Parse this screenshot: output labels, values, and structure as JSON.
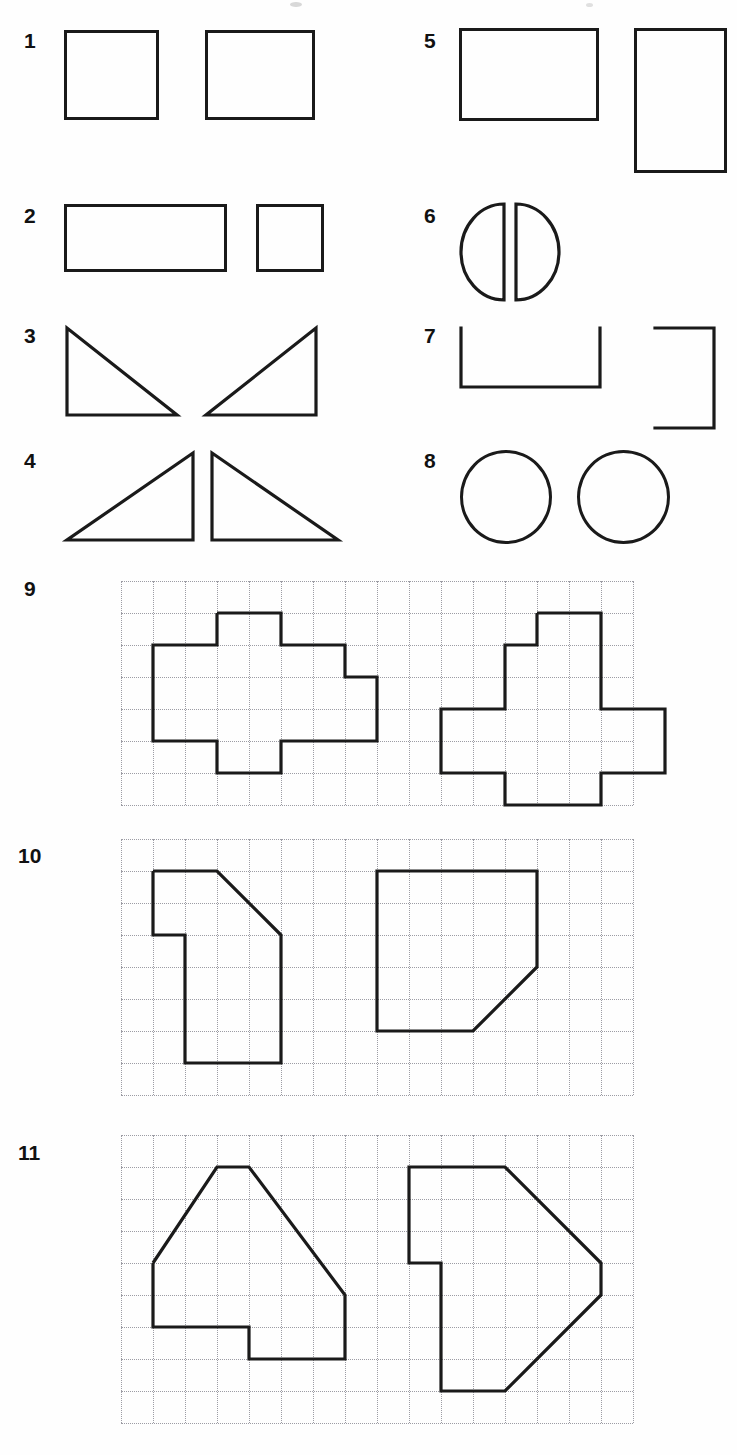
{
  "worksheet": {
    "title": "Congruent and rotated shape pairs worksheet",
    "background_color": "#fefefe",
    "stroke_color": "#1a1a1a",
    "grid_color": "#9c9ca4",
    "label_color": "#111111"
  },
  "items": [
    {
      "number": "1",
      "kind": "plain",
      "description": "two equal squares, side by side"
    },
    {
      "number": "2",
      "kind": "plain",
      "description": "wide rectangle and a small square"
    },
    {
      "number": "3",
      "kind": "plain",
      "description": "two right triangles, mirrored, apex up meeting at bottom centre"
    },
    {
      "number": "4",
      "kind": "plain",
      "description": "two right triangles, mirrored, vertical legs facing inwards"
    },
    {
      "number": "5",
      "kind": "plain",
      "description": "landscape rectangle and the same rectangle rotated 90 degrees"
    },
    {
      "number": "6",
      "kind": "plain",
      "description": "two semicircles, flat sides facing each other"
    },
    {
      "number": "7",
      "kind": "plain",
      "description": "U shape open at the top and the same shape rotated, open to the left"
    },
    {
      "number": "8",
      "kind": "plain",
      "description": "two equal circles"
    },
    {
      "number": "9",
      "kind": "grid",
      "description": "plus-like polyomino and its rotation on dotted grid"
    },
    {
      "number": "10",
      "kind": "grid",
      "description": "L shape with a chamfered corner and its rotation on dotted grid"
    },
    {
      "number": "11",
      "kind": "grid",
      "description": "house-like pentagon-ish polygon and its rotation on dotted grid"
    }
  ],
  "grid_specs": {
    "item9": {
      "cols": 16,
      "rows": 7,
      "cell": 32,
      "x": 121,
      "y": 581,
      "width": 512,
      "height": 224
    },
    "item10": {
      "cols": 16,
      "rows": 8,
      "cell": 32,
      "x": 121,
      "y": 839,
      "width": 512,
      "height": 256
    },
    "item11": {
      "cols": 16,
      "rows": 9,
      "cell": 32,
      "x": 121,
      "y": 1135,
      "width": 512,
      "height": 288
    }
  },
  "shape_paths": {
    "item9_left": "3,1 5,1 5,2 7,2 7,3 8,3 8,5 5,5 5,6 3,6 3,5 1,5 1,2 3,2 3,1",
    "item9_right": "13,1 15,1 15,4 17,4 17,6 15,6 15,7 12,7 12,6 10,6 10,4 12,4 12,2 13,2 13,1",
    "item10_left": "1,1 3,1 5,3 5,7 2,7 2,3 1,3 1,1",
    "item10_right": "9,1 13,1 13,4 11,6 8,6 8,1 9,1",
    "item11_left": "1,4 3,1 4,1 7,5 7,7 4,7 4,6 1,6 1,4",
    "item11_right": "10,1 12,1 15,4 15,5 12,8 10,8 10,4 9,4 9,1 10,1"
  }
}
